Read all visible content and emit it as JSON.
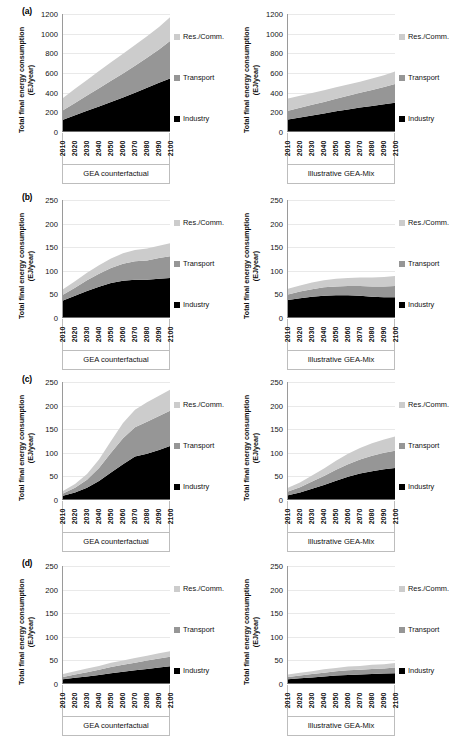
{
  "figure": {
    "panels": [
      "a",
      "b",
      "c",
      "d"
    ],
    "series_names": [
      "Industry",
      "Transport",
      "Res./Comm."
    ],
    "colors": {
      "industry": "#000000",
      "transport": "#969696",
      "res_comm": "#cccccc",
      "grid": "#e9e9e9",
      "axis": "#6b6b6b",
      "text": "#111111"
    },
    "axis": {
      "ylabel_line1": "Total final energy consumption",
      "ylabel_line2": "(EJ/year)",
      "xticks": [
        "2010",
        "2020",
        "2030",
        "2040",
        "2050",
        "2060",
        "2070",
        "2080",
        "2090",
        "2100"
      ],
      "xtitle_left": "GEA counterfactual",
      "xtitle_right": "Illustrative GEA-Mix"
    },
    "legend": {
      "res_comm": "Res./Comm.",
      "transport": "Transport",
      "industry": "Industry"
    },
    "panel_labels": {
      "a": "(a)",
      "b": "(b)",
      "c": "(c)",
      "d": "(d)"
    },
    "yticks": {
      "large": [
        "1200",
        "1000",
        "800",
        "600",
        "400",
        "200",
        "0"
      ],
      "small": [
        "250",
        "200",
        "150",
        "100",
        "50",
        "0"
      ]
    }
  },
  "chart_data": [
    {
      "id": "a-left",
      "type": "area",
      "panel": "(a)",
      "title": "GEA counterfactual",
      "xlabel": "GEA counterfactual",
      "ylabel": "Total final energy consumption (EJ/year)",
      "x": [
        2010,
        2020,
        2030,
        2040,
        2050,
        2060,
        2070,
        2080,
        2090,
        2100
      ],
      "xlim": [
        2010,
        2100
      ],
      "ylim": [
        0,
        1200
      ],
      "yticks": [
        0,
        200,
        400,
        600,
        800,
        1000,
        1200
      ],
      "grid": true,
      "legend_position": "right",
      "stacked": true,
      "series": [
        {
          "name": "Industry",
          "values": [
            125,
            170,
            215,
            260,
            305,
            350,
            400,
            450,
            500,
            548
          ]
        },
        {
          "name": "Transport",
          "values": [
            95,
            125,
            155,
            185,
            215,
            245,
            275,
            305,
            340,
            385
          ]
        },
        {
          "name": "Res./Comm.",
          "values": [
            125,
            145,
            160,
            175,
            190,
            200,
            210,
            220,
            228,
            243
          ]
        }
      ],
      "totals": [
        345,
        440,
        530,
        620,
        710,
        795,
        885,
        975,
        1068,
        1176
      ]
    },
    {
      "id": "a-right",
      "type": "area",
      "panel": "(a)",
      "title": "Illustrative GEA-Mix",
      "xlabel": "Illustrative GEA-Mix",
      "ylabel": "Total final energy consumption (EJ/year)",
      "x": [
        2010,
        2020,
        2030,
        2040,
        2050,
        2060,
        2070,
        2080,
        2090,
        2100
      ],
      "xlim": [
        2010,
        2100
      ],
      "ylim": [
        0,
        1200
      ],
      "yticks": [
        0,
        200,
        400,
        600,
        800,
        1000,
        1200
      ],
      "grid": true,
      "legend_position": "right",
      "stacked": true,
      "series": [
        {
          "name": "Industry",
          "values": [
            128,
            148,
            168,
            188,
            210,
            230,
            248,
            265,
            282,
            300
          ]
        },
        {
          "name": "Transport",
          "values": [
            88,
            98,
            108,
            118,
            128,
            138,
            150,
            162,
            175,
            190
          ]
        },
        {
          "name": "Res./Comm.",
          "values": [
            125,
            122,
            120,
            118,
            116,
            115,
            114,
            116,
            120,
            128
          ]
        }
      ],
      "totals": [
        341,
        368,
        396,
        424,
        454,
        483,
        512,
        543,
        577,
        618
      ]
    },
    {
      "id": "b-left",
      "type": "area",
      "panel": "(b)",
      "title": "GEA counterfactual",
      "xlabel": "GEA counterfactual",
      "ylabel": "Total final energy consumption (EJ/year)",
      "x": [
        2010,
        2020,
        2030,
        2040,
        2050,
        2060,
        2070,
        2080,
        2090,
        2100
      ],
      "xlim": [
        2010,
        2100
      ],
      "ylim": [
        0,
        250
      ],
      "yticks": [
        0,
        50,
        100,
        150,
        200,
        250
      ],
      "grid": true,
      "legend_position": "right",
      "stacked": true,
      "series": [
        {
          "name": "Industry",
          "values": [
            37,
            47,
            57,
            66,
            74,
            79,
            81,
            81,
            83,
            85
          ]
        },
        {
          "name": "Transport",
          "values": [
            12,
            17,
            23,
            28,
            32,
            36,
            39,
            41,
            44,
            46
          ]
        },
        {
          "name": "Res./Comm.",
          "values": [
            12,
            14,
            16,
            18,
            20,
            22,
            24,
            25,
            26,
            28
          ]
        }
      ],
      "totals": [
        61,
        78,
        96,
        112,
        126,
        137,
        144,
        147,
        153,
        159
      ]
    },
    {
      "id": "b-right",
      "type": "area",
      "panel": "(b)",
      "title": "Illustrative GEA-Mix",
      "xlabel": "Illustrative GEA-Mix",
      "ylabel": "Total final energy consumption (EJ/year)",
      "x": [
        2010,
        2020,
        2030,
        2040,
        2050,
        2060,
        2070,
        2080,
        2090,
        2100
      ],
      "xlim": [
        2010,
        2100
      ],
      "ylim": [
        0,
        250
      ],
      "yticks": [
        0,
        50,
        100,
        150,
        200,
        250
      ],
      "grid": true,
      "legend_position": "right",
      "stacked": true,
      "series": [
        {
          "name": "Industry",
          "values": [
            38,
            42,
            45,
            47,
            48,
            48,
            47,
            45,
            44,
            44
          ]
        },
        {
          "name": "Transport",
          "values": [
            12,
            14,
            16,
            18,
            19,
            20,
            21,
            22,
            23,
            24
          ]
        },
        {
          "name": "Res./Comm.",
          "values": [
            12,
            13,
            14,
            15,
            16,
            17,
            18,
            19,
            20,
            21
          ]
        }
      ],
      "totals": [
        62,
        69,
        75,
        80,
        83,
        85,
        86,
        86,
        87,
        89
      ]
    },
    {
      "id": "c-left",
      "type": "area",
      "panel": "(c)",
      "title": "GEA counterfactual",
      "xlabel": "GEA counterfactual",
      "ylabel": "Total final energy consumption (EJ/year)",
      "x": [
        2010,
        2020,
        2030,
        2040,
        2050,
        2060,
        2070,
        2080,
        2090,
        2100
      ],
      "xlim": [
        2010,
        2100
      ],
      "ylim": [
        0,
        250
      ],
      "yticks": [
        0,
        50,
        100,
        150,
        200,
        250
      ],
      "grid": true,
      "legend_position": "right",
      "stacked": true,
      "series": [
        {
          "name": "Industry",
          "values": [
            9,
            16,
            26,
            40,
            58,
            76,
            92,
            98,
            106,
            115
          ]
        },
        {
          "name": "Transport",
          "values": [
            5,
            10,
            17,
            28,
            42,
            55,
            62,
            68,
            72,
            75
          ]
        },
        {
          "name": "Res./Comm.",
          "values": [
            5,
            8,
            12,
            18,
            25,
            32,
            37,
            41,
            43,
            45
          ]
        }
      ],
      "totals": [
        19,
        34,
        55,
        86,
        125,
        163,
        191,
        207,
        221,
        235
      ]
    },
    {
      "id": "c-right",
      "type": "area",
      "panel": "(c)",
      "title": "Illustrative GEA-Mix",
      "xlabel": "Illustrative GEA-Mix",
      "ylabel": "Total final energy consumption (EJ/year)",
      "x": [
        2010,
        2020,
        2030,
        2040,
        2050,
        2060,
        2070,
        2080,
        2090,
        2100
      ],
      "xlim": [
        2010,
        2100
      ],
      "ylim": [
        0,
        250
      ],
      "yticks": [
        0,
        50,
        100,
        150,
        200,
        250
      ],
      "grid": true,
      "legend_position": "right",
      "stacked": true,
      "series": [
        {
          "name": "Industry",
          "values": [
            10,
            16,
            24,
            32,
            41,
            49,
            56,
            61,
            65,
            68
          ]
        },
        {
          "name": "Transport",
          "values": [
            8,
            11,
            15,
            19,
            23,
            27,
            30,
            33,
            35,
            37
          ]
        },
        {
          "name": "Res./Comm.",
          "values": [
            8,
            10,
            13,
            16,
            19,
            22,
            24,
            26,
            28,
            30
          ]
        }
      ],
      "totals": [
        26,
        37,
        52,
        67,
        83,
        98,
        110,
        120,
        128,
        135
      ]
    },
    {
      "id": "d-left",
      "type": "area",
      "panel": "(d)",
      "title": "GEA counterfactual",
      "xlabel": "GEA counterfactual",
      "ylabel": "Total final energy consumption (EJ/year)",
      "x": [
        2010,
        2020,
        2030,
        2040,
        2050,
        2060,
        2070,
        2080,
        2090,
        2100
      ],
      "xlim": [
        2010,
        2100
      ],
      "ylim": [
        0,
        250
      ],
      "yticks": [
        0,
        50,
        100,
        150,
        200,
        250
      ],
      "grid": true,
      "legend_position": "right",
      "stacked": true,
      "series": [
        {
          "name": "Industry",
          "values": [
            10,
            13,
            16,
            19,
            23,
            26,
            29,
            32,
            35,
            38
          ]
        },
        {
          "name": "Transport",
          "values": [
            5,
            7,
            9,
            11,
            13,
            15,
            16,
            18,
            19,
            20
          ]
        },
        {
          "name": "Res./Comm.",
          "values": [
            6,
            7,
            8,
            8,
            9,
            9,
            10,
            10,
            11,
            12
          ]
        }
      ],
      "totals": [
        21,
        27,
        33,
        38,
        45,
        50,
        55,
        60,
        65,
        70
      ]
    },
    {
      "id": "d-right",
      "type": "area",
      "panel": "(d)",
      "title": "Illustrative GEA-Mix",
      "xlabel": "Illustrative GEA-Mix",
      "ylabel": "Total final energy consumption (EJ/year)",
      "x": [
        2010,
        2020,
        2030,
        2040,
        2050,
        2060,
        2070,
        2080,
        2090,
        2100
      ],
      "xlim": [
        2010,
        2100
      ],
      "ylim": [
        0,
        250
      ],
      "yticks": [
        0,
        50,
        100,
        150,
        200,
        250
      ],
      "grid": true,
      "legend_position": "right",
      "stacked": true,
      "series": [
        {
          "name": "Industry",
          "values": [
            10,
            12,
            14,
            16,
            18,
            19,
            20,
            21,
            22,
            23
          ]
        },
        {
          "name": "Transport",
          "values": [
            5,
            6,
            7,
            8,
            9,
            10,
            10,
            11,
            11,
            12
          ]
        },
        {
          "name": "Res./Comm.",
          "values": [
            5,
            6,
            6,
            7,
            7,
            8,
            8,
            9,
            9,
            10
          ]
        }
      ],
      "totals": [
        20,
        24,
        27,
        31,
        34,
        37,
        38,
        41,
        42,
        45
      ]
    }
  ]
}
